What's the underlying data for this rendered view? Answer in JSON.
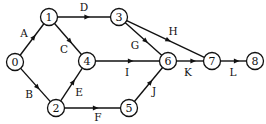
{
  "diagram": {
    "type": "activity-on-arrow network",
    "nodes": [
      {
        "id": "0",
        "label": "0"
      },
      {
        "id": "1",
        "label": "1"
      },
      {
        "id": "2",
        "label": "2"
      },
      {
        "id": "3",
        "label": "3"
      },
      {
        "id": "4",
        "label": "4"
      },
      {
        "id": "5",
        "label": "5"
      },
      {
        "id": "6",
        "label": "6"
      },
      {
        "id": "7",
        "label": "7"
      },
      {
        "id": "8",
        "label": "8"
      }
    ],
    "edges": [
      {
        "from": "0",
        "to": "1",
        "label": "A"
      },
      {
        "from": "0",
        "to": "2",
        "label": "B"
      },
      {
        "from": "1",
        "to": "4",
        "label": "C"
      },
      {
        "from": "1",
        "to": "3",
        "label": "D"
      },
      {
        "from": "2",
        "to": "4",
        "label": "E"
      },
      {
        "from": "2",
        "to": "5",
        "label": "F"
      },
      {
        "from": "3",
        "to": "6",
        "label": "G"
      },
      {
        "from": "3",
        "to": "7",
        "label": "H"
      },
      {
        "from": "4",
        "to": "6",
        "label": "I"
      },
      {
        "from": "5",
        "to": "6",
        "label": "J"
      },
      {
        "from": "6",
        "to": "7",
        "label": "K"
      },
      {
        "from": "7",
        "to": "8",
        "label": "L"
      }
    ]
  }
}
